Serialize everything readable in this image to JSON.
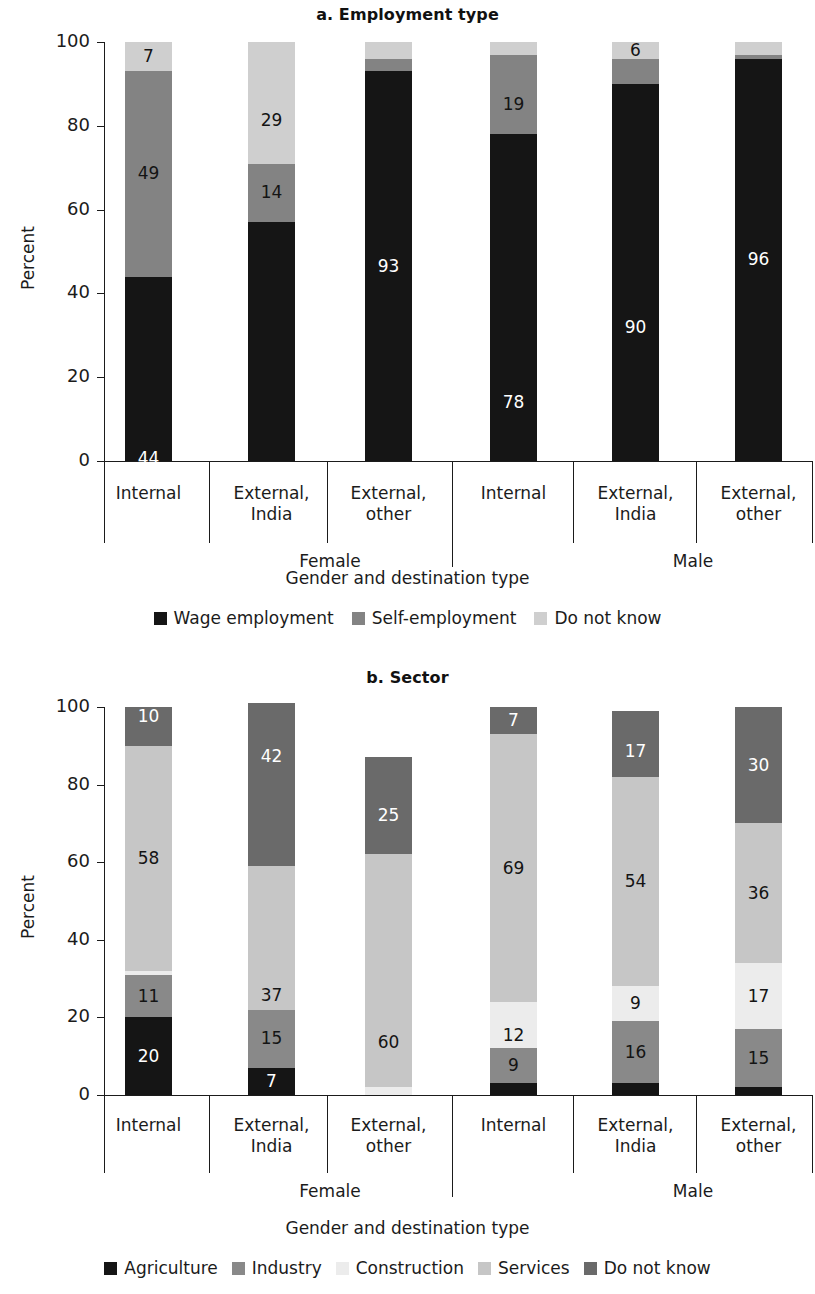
{
  "figure": {
    "panels": [
      {
        "title": "a. Employment type",
        "ylabel": "Percent",
        "xlabel": "Gender and destination type",
        "yticks": [
          "0",
          "20",
          "40",
          "60",
          "80",
          "100"
        ],
        "categories": [
          "Internal",
          "External,\nIndia",
          "External,\nother",
          "Internal",
          "External,\nIndia",
          "External,\nother"
        ],
        "groups": [
          "Female",
          "Male"
        ],
        "legend": [
          {
            "label": "Wage employment",
            "color": "#151515"
          },
          {
            "label": "Self-employment",
            "color": "#838383"
          },
          {
            "label": "Do not know",
            "color": "#cfcfcf"
          }
        ]
      },
      {
        "title": "b. Sector",
        "ylabel": "Percent",
        "xlabel": "Gender and destination type",
        "yticks": [
          "0",
          "20",
          "40",
          "60",
          "80",
          "100"
        ],
        "categories": [
          "Internal",
          "External,\nIndia",
          "External,\nother",
          "Internal",
          "External,\nIndia",
          "External,\nother"
        ],
        "groups": [
          "Female",
          "Male"
        ],
        "legend": [
          {
            "label": "Agriculture",
            "color": "#151515"
          },
          {
            "label": "Industry",
            "color": "#898989"
          },
          {
            "label": "Construction",
            "color": "#ececec"
          },
          {
            "label": "Services",
            "color": "#c6c6c6"
          },
          {
            "label": "Do not know",
            "color": "#6a6a6a"
          }
        ]
      }
    ]
  },
  "chart_data": [
    {
      "type": "bar",
      "stacked": true,
      "title": "a. Employment type",
      "xlabel": "Gender and destination type",
      "ylabel": "Percent",
      "ylim": [
        0,
        100
      ],
      "yticks": [
        0,
        20,
        40,
        60,
        80,
        100
      ],
      "grid": false,
      "legend_position": "bottom",
      "group_labels": [
        "Female",
        "Male"
      ],
      "categories": [
        "Female / Internal",
        "Female / External, India",
        "Female / External, other",
        "Male / Internal",
        "Male / External, India",
        "Male / External, other"
      ],
      "series": [
        {
          "name": "Wage employment",
          "color": "#151515",
          "values": [
            44,
            57,
            93,
            78,
            90,
            96
          ]
        },
        {
          "name": "Self-employment",
          "color": "#838383",
          "values": [
            49,
            14,
            3,
            19,
            6,
            1
          ]
        },
        {
          "name": "Do not know",
          "color": "#cfcfcf",
          "values": [
            7,
            29,
            4,
            3,
            4,
            3
          ]
        }
      ],
      "data_labels": {
        "Wage employment": [
          "44",
          "57",
          "93",
          "78",
          "90",
          "96"
        ],
        "Self-employment": [
          "49",
          "14",
          "",
          "19",
          "",
          ""
        ],
        "Do not know": [
          "7",
          "29",
          "",
          "",
          "6",
          ""
        ]
      }
    },
    {
      "type": "bar",
      "stacked": true,
      "title": "b. Sector",
      "xlabel": "Gender and destination type",
      "ylabel": "Percent",
      "ylim": [
        0,
        100
      ],
      "yticks": [
        0,
        20,
        40,
        60,
        80,
        100
      ],
      "grid": false,
      "legend_position": "bottom",
      "group_labels": [
        "Female",
        "Male"
      ],
      "categories": [
        "Female / Internal",
        "Female / External, India",
        "Female / External, other",
        "Male / Internal",
        "Male / External, India",
        "Male / External, other"
      ],
      "series": [
        {
          "name": "Agriculture",
          "color": "#151515",
          "values": [
            20,
            7,
            0,
            3,
            3,
            2
          ]
        },
        {
          "name": "Industry",
          "color": "#898989",
          "values": [
            11,
            15,
            0,
            9,
            16,
            15
          ]
        },
        {
          "name": "Construction",
          "color": "#ececec",
          "values": [
            1,
            0,
            2,
            12,
            9,
            17
          ]
        },
        {
          "name": "Services",
          "color": "#c6c6c6",
          "values": [
            58,
            37,
            60,
            69,
            54,
            36
          ]
        },
        {
          "name": "Do not know",
          "color": "#6a6a6a",
          "values": [
            10,
            42,
            25,
            7,
            17,
            30
          ]
        }
      ],
      "data_labels": {
        "Agriculture": [
          "20",
          "7",
          "",
          "",
          "",
          ""
        ],
        "Industry": [
          "11",
          "15",
          "",
          "9",
          "16",
          "15"
        ],
        "Construction": [
          "",
          "",
          "",
          "12",
          "9",
          "17"
        ],
        "Services": [
          "58",
          "37",
          "60",
          "69",
          "54",
          "36"
        ],
        "Do not know": [
          "10",
          "42",
          "25",
          "7",
          "17",
          "30"
        ]
      }
    }
  ]
}
